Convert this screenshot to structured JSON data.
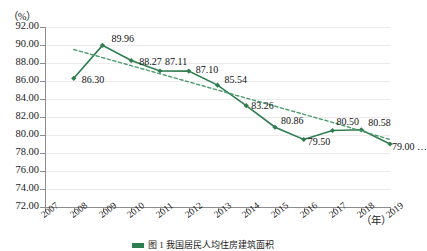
{
  "chart_data": {
    "type": "line",
    "title": "",
    "xlabel": "(年)",
    "ylabel": "(%)",
    "ylim": [
      72.0,
      92.0
    ],
    "ystep": 2.0,
    "xlim": [
      2007,
      2019
    ],
    "grid": true,
    "legend_position": "none",
    "ytick_labels": [
      "92.00",
      "90.00",
      "88.00",
      "86.00",
      "84.00",
      "82.00",
      "80.00",
      "78.00",
      "76.00",
      "74.00",
      "72.00"
    ],
    "xtick_labels": [
      "2007",
      "2008",
      "2009",
      "2010",
      "2011",
      "2012",
      "2013",
      "2014",
      "2015",
      "2016",
      "2017",
      "2018",
      "2019"
    ],
    "x": [
      2008,
      2009,
      2010,
      2011,
      2012,
      2013,
      2014,
      2015,
      2016,
      2017,
      2018,
      2019
    ],
    "values": [
      86.3,
      89.96,
      88.27,
      87.11,
      87.1,
      85.54,
      83.26,
      80.86,
      79.5,
      80.5,
      80.58,
      79.0
    ],
    "point_labels": [
      "86.30",
      "89.96",
      "88.27",
      "87.11",
      "87.10",
      "85.54",
      "83.26",
      "80.86",
      "79.50",
      "80.50",
      "80.58",
      "79.00 …"
    ],
    "series": [
      {
        "name": "主系列",
        "style": "solid",
        "color": "#2e7d4f",
        "marker": "diamond",
        "values": [
          86.3,
          89.96,
          88.27,
          87.11,
          87.1,
          85.54,
          83.26,
          80.86,
          79.5,
          80.5,
          80.58,
          79.0
        ]
      },
      {
        "name": "趋势线",
        "style": "dashed",
        "color": "#4c9b6d",
        "marker": "none",
        "values": [
          89.5,
          88.6,
          87.7,
          86.8,
          85.9,
          85.0,
          84.1,
          83.2,
          82.3,
          81.4,
          80.45,
          79.5
        ]
      }
    ]
  },
  "axis": {
    "y_unit": "（%）",
    "x_unit": "（年）"
  },
  "caption": {
    "text": "图 1  我国居民人均住房建筑面积"
  },
  "colors": {
    "line": "#2e7d4f",
    "trend": "#4c9b6d",
    "grid": "#eceaea",
    "axis": "#8d8d8d",
    "text": "#1a1a1a"
  }
}
